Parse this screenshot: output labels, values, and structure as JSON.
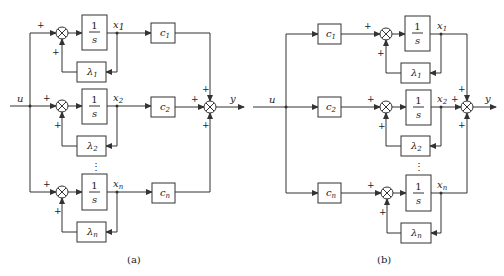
{
  "figure": {
    "panel_a": {
      "caption": "(a)",
      "input_label": "u",
      "output_label": "y",
      "rows": [
        {
          "integrator_num": "1",
          "integrator_den": "s",
          "state": "x",
          "state_sub": "1",
          "gain": "c",
          "gain_sub": "1",
          "feedback": "λ",
          "feedback_sub": "1"
        },
        {
          "integrator_num": "1",
          "integrator_den": "s",
          "state": "x",
          "state_sub": "2",
          "gain": "c",
          "gain_sub": "2",
          "feedback": "λ",
          "feedback_sub": "2"
        },
        {
          "integrator_num": "1",
          "integrator_den": "s",
          "state": "x",
          "state_sub": "n",
          "gain": "c",
          "gain_sub": "n",
          "feedback": "λ",
          "feedback_sub": "n"
        }
      ],
      "ellipsis": "⋮",
      "plus": "+"
    },
    "panel_b": {
      "caption": "(b)",
      "input_label": "u",
      "output_label": "y",
      "rows": [
        {
          "integrator_num": "1",
          "integrator_den": "s",
          "state": "x",
          "state_sub": "1",
          "gain": "c",
          "gain_sub": "1",
          "feedback": "λ",
          "feedback_sub": "1"
        },
        {
          "integrator_num": "1",
          "integrator_den": "s",
          "state": "x",
          "state_sub": "2",
          "gain": "c",
          "gain_sub": "2",
          "feedback": "λ",
          "feedback_sub": "2"
        },
        {
          "integrator_num": "1",
          "integrator_den": "s",
          "state": "x",
          "state_sub": "n",
          "gain": "c",
          "gain_sub": "n",
          "feedback": "λ",
          "feedback_sub": "n"
        }
      ],
      "ellipsis": "⋮",
      "plus": "+"
    },
    "colors": {
      "stroke": "#333333",
      "background": "#ffffff"
    }
  }
}
